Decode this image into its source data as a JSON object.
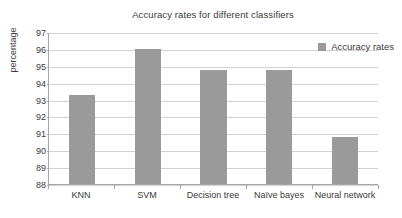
{
  "chart_data": {
    "type": "bar",
    "title": "Accuracy rates for different classifiers",
    "xlabel": "",
    "ylabel": "percentage",
    "categories": [
      "KNN",
      "SVM",
      "Decision tree",
      "Naïve bayes",
      "Neural network"
    ],
    "values": [
      93.3,
      96.05,
      94.78,
      94.8,
      90.78
    ],
    "series": [
      {
        "name": "Accuracy rates",
        "values": [
          93.3,
          96.05,
          94.78,
          94.8,
          90.78
        ]
      }
    ],
    "ylim": [
      88,
      97
    ],
    "yticks": [
      88,
      89,
      90,
      91,
      92,
      93,
      94,
      95,
      96,
      97
    ],
    "ytick_labels": [
      "88",
      "89",
      "90",
      "91",
      "92",
      "93",
      "94",
      "95",
      "96",
      "97"
    ],
    "grid": true,
    "legend": {
      "position": "top-right",
      "entries": [
        {
          "label": "Accuracy rates",
          "color": "#9a9a9a"
        }
      ]
    },
    "colors": {
      "bar": "#9a9a9a",
      "gridline": "#d2d2d2",
      "axis": "#a6a6a6",
      "text": "#3a3a3a",
      "background": "#ffffff"
    }
  }
}
